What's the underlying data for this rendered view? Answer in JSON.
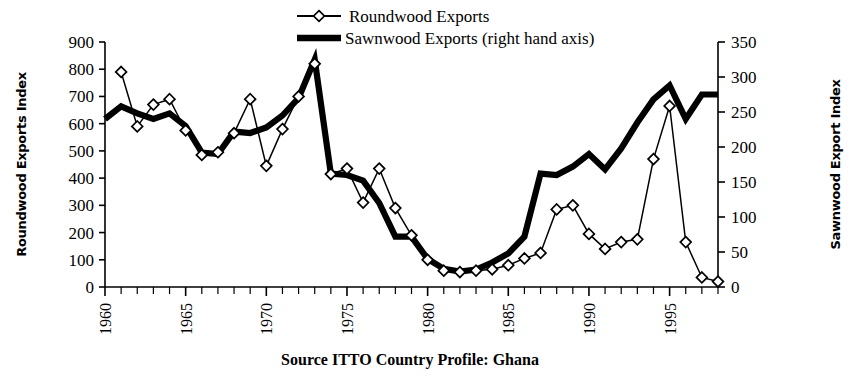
{
  "chart_data": {
    "type": "line",
    "title": "",
    "caption": "Source  ITTO Country Profile: Ghana",
    "xlabel": "",
    "ylabel": "Roundwood Exports Index",
    "y2label": "Sawnwood Export Index",
    "grid": false,
    "legend_position": "top-center",
    "xlim": [
      1960,
      1998
    ],
    "ylim": [
      0,
      900
    ],
    "y2lim": [
      0,
      350
    ],
    "xticks": [
      "1960",
      "1965",
      "1970",
      "1975",
      "1980",
      "1985",
      "1990",
      "1995"
    ],
    "xtick_values": [
      1960,
      1965,
      1970,
      1975,
      1980,
      1985,
      1990,
      1995
    ],
    "yticks": [
      "0",
      "100",
      "200",
      "300",
      "400",
      "500",
      "600",
      "700",
      "800",
      "900"
    ],
    "ytick_values": [
      0,
      100,
      200,
      300,
      400,
      500,
      600,
      700,
      800,
      900
    ],
    "y2ticks": [
      "0",
      "50",
      "100",
      "150",
      "200",
      "250",
      "300",
      "350"
    ],
    "y2tick_values": [
      0,
      50,
      100,
      150,
      200,
      250,
      300,
      350
    ],
    "x": [
      1960,
      1961,
      1962,
      1963,
      1964,
      1965,
      1966,
      1967,
      1968,
      1969,
      1970,
      1971,
      1972,
      1973,
      1974,
      1975,
      1976,
      1977,
      1978,
      1979,
      1980,
      1981,
      1982,
      1983,
      1984,
      1985,
      1986,
      1987,
      1988,
      1989,
      1990,
      1991,
      1992,
      1993,
      1994,
      1995,
      1996,
      1997,
      1998
    ],
    "series": [
      {
        "name": "Roundwood Exports",
        "axis": "left",
        "marker": "diamond",
        "values": [
          null,
          790,
          590,
          670,
          690,
          575,
          485,
          495,
          565,
          690,
          445,
          580,
          700,
          820,
          415,
          435,
          310,
          435,
          290,
          190,
          100,
          60,
          55,
          60,
          65,
          80,
          105,
          125,
          285,
          300,
          195,
          140,
          165,
          175,
          470,
          665,
          165,
          35,
          20
        ]
      },
      {
        "name": "Sawnwood Exports (right hand axis)",
        "axis": "right",
        "marker": "none",
        "values": [
          240,
          258,
          248,
          240,
          248,
          230,
          192,
          190,
          222,
          220,
          228,
          245,
          270,
          325,
          162,
          160,
          152,
          120,
          72,
          72,
          40,
          26,
          22,
          25,
          35,
          48,
          72,
          162,
          160,
          172,
          190,
          168,
          198,
          235,
          268,
          288,
          240,
          275,
          275
        ]
      }
    ]
  },
  "legend": {
    "items": [
      {
        "label": "Roundwood Exports",
        "marker": "diamond-line"
      },
      {
        "label": "Sawnwood Exports (right hand axis)",
        "marker": "thick-line"
      }
    ]
  },
  "axes": {
    "left_title": "Roundwood Exports Index",
    "right_title": "Sawnwood Export Index"
  },
  "caption": {
    "text": "Source  ITTO Country Profile: Ghana"
  },
  "colors": {
    "ink": "#000000",
    "background": "#ffffff"
  }
}
